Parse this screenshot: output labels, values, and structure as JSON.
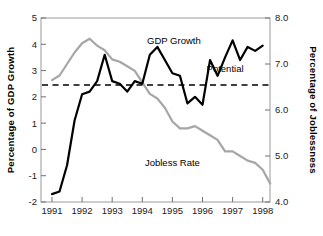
{
  "chart_data": {
    "type": "line",
    "title": "",
    "xlabel": "",
    "ylabel": "Percentage of GDP Growth",
    "y2label": "Percentage of Joblessness",
    "grid": false,
    "legend": "inline-annotations",
    "xlim": [
      1990.75,
      1998.5
    ],
    "ylim": [
      -2,
      5
    ],
    "y2lim": [
      4.0,
      8.0
    ],
    "xticks": [
      1991,
      1992,
      1993,
      1994,
      1995,
      1996,
      1997,
      1998
    ],
    "xtick_labels": [
      "1991",
      "1992",
      "1993",
      "1994",
      "1995",
      "1996",
      "1997",
      "1998"
    ],
    "yticks": [
      -2,
      -1,
      0,
      1,
      2,
      3,
      4,
      5
    ],
    "ytick_labels": [
      "-2",
      "-1",
      "0",
      "1",
      "2",
      "3",
      "4",
      "5"
    ],
    "y2ticks": [
      4.0,
      5.0,
      6.0,
      7.0,
      8.0
    ],
    "y2tick_labels": [
      "4.0",
      "5.0",
      "6.0",
      "7.0",
      "8.0"
    ],
    "annotations": [
      {
        "text": "GDP Growth",
        "x": 1995.05,
        "y": 4.02,
        "name": "gdp-growth-label"
      },
      {
        "text": "Potential",
        "x": 1996.75,
        "y": 2.95,
        "name": "potential-label"
      },
      {
        "text": "Jobless Rate",
        "x": 1995.0,
        "y": -0.62,
        "name": "jobless-rate-label"
      }
    ],
    "reference_line": {
      "name": "Potential",
      "axis": "left",
      "value": 2.45,
      "style": "dashed",
      "color": "#000000"
    },
    "series": [
      {
        "name": "GDP Growth",
        "axis": "left",
        "color": "#000000",
        "unit": "percent",
        "x": [
          1991.0,
          1991.25,
          1991.5,
          1991.75,
          1992.0,
          1992.25,
          1992.5,
          1992.75,
          1993.0,
          1993.25,
          1993.5,
          1993.75,
          1994.0,
          1994.25,
          1994.5,
          1994.75,
          1995.0,
          1995.25,
          1995.5,
          1995.75,
          1996.0,
          1996.25,
          1996.5,
          1996.75,
          1997.0,
          1997.25,
          1997.5,
          1997.75,
          1998.0
        ],
        "values": [
          -1.7,
          -1.6,
          -0.6,
          1.1,
          2.1,
          2.2,
          2.6,
          3.6,
          2.6,
          2.5,
          2.2,
          2.6,
          2.5,
          3.6,
          3.9,
          3.4,
          2.9,
          2.8,
          1.75,
          2.0,
          1.7,
          3.4,
          2.8,
          3.5,
          4.15,
          3.4,
          3.9,
          3.75,
          3.95
        ]
      },
      {
        "name": "Jobless Rate",
        "axis": "right",
        "color": "#a6a6a6",
        "unit": "percent",
        "x": [
          1991.0,
          1991.25,
          1991.5,
          1991.75,
          1992.0,
          1992.25,
          1992.5,
          1992.75,
          1993.0,
          1993.25,
          1993.5,
          1993.75,
          1994.0,
          1994.25,
          1994.5,
          1994.75,
          1995.0,
          1995.25,
          1995.5,
          1995.75,
          1996.0,
          1996.25,
          1996.5,
          1996.75,
          1997.0,
          1997.25,
          1997.5,
          1997.75,
          1998.0,
          1998.25
        ],
        "values": [
          6.65,
          6.75,
          7.0,
          7.25,
          7.45,
          7.55,
          7.4,
          7.3,
          7.1,
          7.05,
          6.95,
          6.85,
          6.6,
          6.35,
          6.25,
          6.05,
          5.75,
          5.6,
          5.6,
          5.65,
          5.55,
          5.45,
          5.35,
          5.1,
          5.1,
          5.0,
          4.9,
          4.85,
          4.7,
          4.4
        ]
      }
    ]
  },
  "layout": {
    "plot_left": 41,
    "plot_right": 270,
    "plot_top": 18,
    "plot_bottom": 202,
    "x_of_1991": 52,
    "px_per_year": 30.1
  }
}
